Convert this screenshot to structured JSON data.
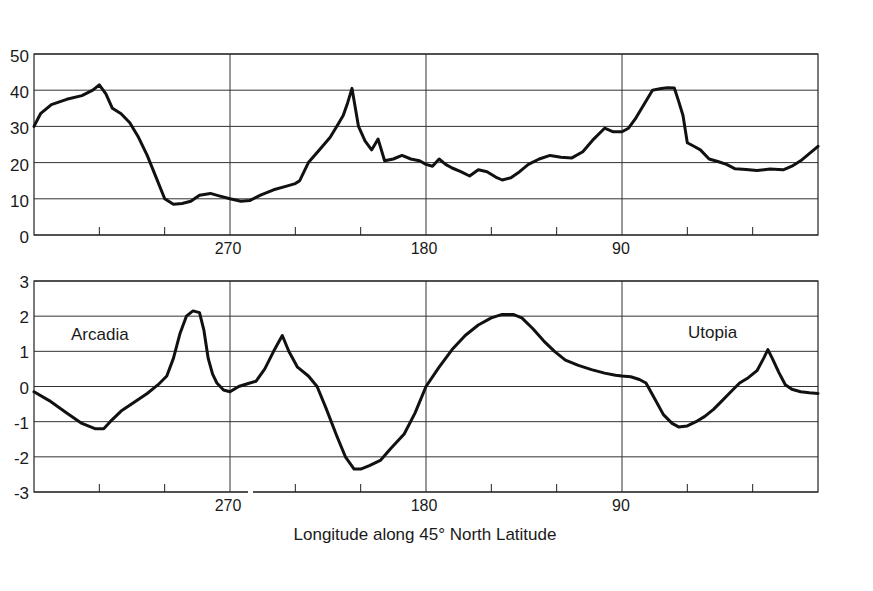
{
  "chart_data": [
    {
      "type": "line",
      "title": "",
      "xlabel": "",
      "ylabel": "",
      "xlim": [
        360,
        0
      ],
      "ylim": [
        0,
        50
      ],
      "yticks": [
        0,
        10,
        20,
        30,
        40,
        50
      ],
      "xticks_labeled": [
        270,
        180,
        90
      ],
      "xticks_minor": [
        330,
        300,
        240,
        210,
        150,
        120,
        60,
        30
      ],
      "grid": {
        "horizontal": true,
        "vertical_at": [
          270,
          180,
          90
        ]
      },
      "legend": null,
      "series": [
        {
          "name": "upper profile",
          "x": [
            360,
            357,
            352,
            345,
            338,
            333,
            330,
            327,
            324,
            320,
            316,
            312,
            308,
            304,
            300,
            296,
            292,
            288,
            284,
            279,
            275,
            270,
            265,
            261,
            256,
            250,
            244,
            240,
            238,
            234,
            229,
            224,
            221,
            218,
            216,
            214,
            211,
            208,
            205,
            202,
            199,
            195,
            191,
            187,
            183,
            180,
            177,
            174,
            171,
            168,
            164,
            160,
            156,
            152,
            148,
            145,
            141,
            137,
            133,
            128,
            123,
            118,
            113,
            108,
            103,
            98,
            94,
            90,
            87,
            84,
            80,
            76,
            72,
            69,
            66,
            64,
            62,
            60,
            57,
            54,
            50,
            46,
            42,
            38,
            33,
            28,
            22,
            16,
            12,
            8,
            4,
            0
          ],
          "y": [
            30,
            33.5,
            36,
            37.5,
            38.5,
            40,
            41.5,
            39,
            35,
            33.5,
            31,
            27,
            22,
            16,
            10,
            8.5,
            8.7,
            9.3,
            11,
            11.5,
            10.8,
            10,
            9.3,
            9.5,
            11,
            12.5,
            13.5,
            14.2,
            15,
            20,
            23.5,
            27,
            30,
            33,
            36.5,
            40.5,
            30,
            26,
            23.5,
            26.5,
            20.5,
            21,
            22,
            21,
            20.5,
            19.5,
            19,
            21,
            19.5,
            18.5,
            17.5,
            16.3,
            18,
            17.5,
            16,
            15.2,
            15.8,
            17.5,
            19.5,
            21,
            22,
            21.5,
            21.3,
            23,
            26.5,
            29.5,
            28.5,
            28.5,
            29.5,
            32,
            36,
            40,
            40.5,
            40.7,
            40.6,
            37,
            33,
            25.5,
            24.5,
            23.5,
            21,
            20.3,
            19.5,
            18.3,
            18.1,
            17.8,
            18.2,
            18,
            19,
            20.5,
            22.5,
            24.5
          ]
        }
      ]
    },
    {
      "type": "line",
      "title": "",
      "xlabel": "Longitude along 45° North Latitude",
      "ylabel": "",
      "xlim": [
        360,
        0
      ],
      "ylim": [
        -3,
        3
      ],
      "yticks": [
        -3,
        -2,
        -1,
        0,
        1,
        2,
        3
      ],
      "xticks_labeled": [
        270,
        180,
        90
      ],
      "xticks_minor": [
        330,
        300,
        240,
        210,
        150,
        120,
        60,
        30
      ],
      "grid": {
        "horizontal": true,
        "vertical_at": [
          270,
          180,
          90
        ]
      },
      "legend": null,
      "annotations": [
        {
          "text": "Arcadia",
          "x": 325,
          "y": 1.45
        },
        {
          "text": "Utopia",
          "x": 47,
          "y": 1.55
        }
      ],
      "series": [
        {
          "name": "lower profile",
          "x": [
            360,
            353,
            345,
            338,
            332,
            328,
            325,
            320,
            314,
            308,
            303,
            299,
            296,
            293,
            290,
            287,
            284,
            282,
            280,
            278,
            276,
            273,
            270,
            266,
            262,
            258,
            254,
            250,
            246,
            243,
            239,
            234,
            230,
            226,
            221,
            217,
            213,
            210,
            206,
            201,
            196,
            190,
            185,
            180,
            174,
            168,
            162,
            156,
            150,
            145,
            140,
            136,
            131,
            126,
            121,
            116,
            110,
            104,
            98,
            93,
            90,
            86,
            82,
            79,
            75,
            71,
            67,
            64,
            60,
            56,
            52,
            48,
            44,
            40,
            36,
            32,
            28,
            25,
            23,
            21,
            18,
            15,
            12,
            8,
            4,
            0
          ],
          "y": [
            -0.15,
            -0.4,
            -0.75,
            -1.05,
            -1.2,
            -1.2,
            -1.0,
            -0.7,
            -0.45,
            -0.2,
            0.05,
            0.3,
            0.8,
            1.5,
            2.0,
            2.15,
            2.1,
            1.6,
            0.8,
            0.35,
            0.1,
            -0.1,
            -0.15,
            0.0,
            0.08,
            0.15,
            0.5,
            1.0,
            1.45,
            1.0,
            0.55,
            0.3,
            0.0,
            -0.6,
            -1.4,
            -2.0,
            -2.35,
            -2.35,
            -2.25,
            -2.1,
            -1.75,
            -1.35,
            -0.75,
            0.0,
            0.55,
            1.05,
            1.45,
            1.75,
            1.95,
            2.05,
            2.05,
            1.95,
            1.65,
            1.3,
            1.0,
            0.75,
            0.6,
            0.48,
            0.38,
            0.32,
            0.3,
            0.28,
            0.2,
            0.1,
            -0.35,
            -0.8,
            -1.05,
            -1.15,
            -1.12,
            -1.0,
            -0.85,
            -0.65,
            -0.4,
            -0.15,
            0.1,
            0.25,
            0.45,
            0.8,
            1.05,
            0.8,
            0.4,
            0.05,
            -0.08,
            -0.15,
            -0.18,
            -0.2
          ]
        }
      ]
    }
  ],
  "labels": {
    "top_yticks": [
      "50",
      "40",
      "30",
      "20",
      "10",
      "0"
    ],
    "bottom_yticks": [
      "3",
      "2",
      "1",
      "0",
      "-1",
      "-2",
      "-3"
    ],
    "xticks": [
      "270",
      "180",
      "90"
    ],
    "xlabel": "Longitude along 45° North Latitude",
    "arcadia": "Arcadia",
    "utopia": "Utopia"
  }
}
